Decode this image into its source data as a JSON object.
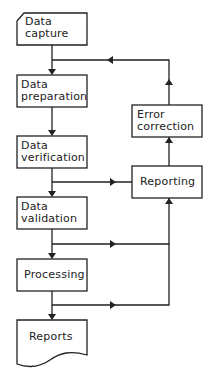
{
  "diagram": {
    "type": "flowchart",
    "nodes": {
      "data_capture": {
        "line1": "Data",
        "line2": "capture",
        "shape": "manual-input"
      },
      "data_preparation": {
        "line1": "Data",
        "line2": "preparation",
        "shape": "process"
      },
      "data_verification": {
        "line1": "Data",
        "line2": "verification",
        "shape": "process"
      },
      "data_validation": {
        "line1": "Data",
        "line2": "validation",
        "shape": "process"
      },
      "processing": {
        "label": "Processing",
        "shape": "process"
      },
      "reports": {
        "label": "Reports",
        "shape": "document"
      },
      "error_correction": {
        "line1": "Error",
        "line2": "correction",
        "shape": "process"
      },
      "reporting": {
        "label": "Reporting",
        "shape": "process"
      }
    },
    "edges": [
      [
        "data_capture",
        "data_preparation"
      ],
      [
        "data_preparation",
        "data_verification"
      ],
      [
        "data_verification",
        "data_validation"
      ],
      [
        "data_verification",
        "reporting"
      ],
      [
        "data_validation",
        "processing"
      ],
      [
        "data_validation",
        "reporting"
      ],
      [
        "processing",
        "reports"
      ],
      [
        "processing",
        "reporting"
      ],
      [
        "reporting",
        "error_correction"
      ],
      [
        "error_correction",
        "data_preparation"
      ]
    ],
    "colors": {
      "stroke": "#222222",
      "background": "#ffffff"
    }
  }
}
